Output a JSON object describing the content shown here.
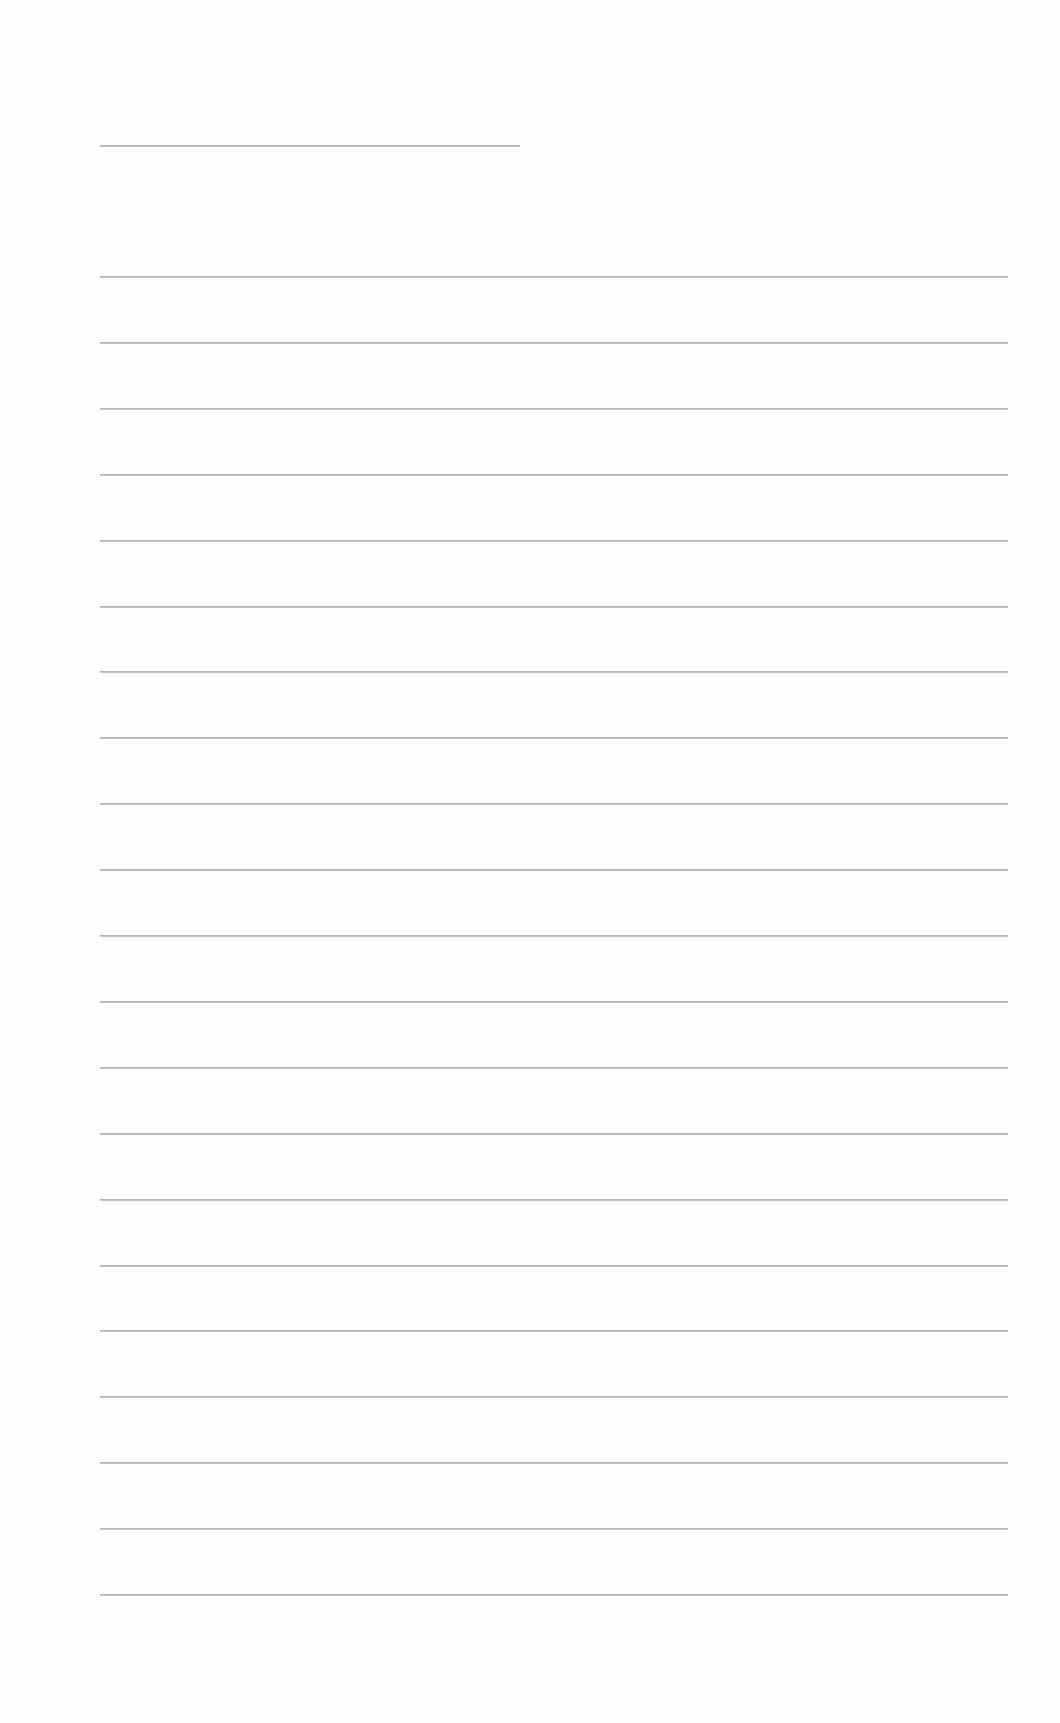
{
  "document": {
    "type": "lined-paper",
    "title_line": {
      "top": 145,
      "left": 100,
      "width": 420
    },
    "lines": {
      "count": 21,
      "first_top": 276,
      "spacing": 65.9,
      "left": 100,
      "width": 908
    },
    "colors": {
      "background": "#fefefe",
      "rule": "#b4b4b4"
    }
  }
}
